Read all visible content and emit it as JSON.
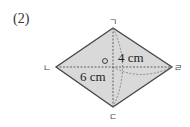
{
  "problem": {
    "number": "(2)"
  },
  "figure": {
    "shape": "rhombus",
    "vertices": {
      "top": "ㄱ",
      "left": "ㄴ",
      "bottom": "ㄷ",
      "right": "ㄹ",
      "center": "ㅇ"
    },
    "dimensions": {
      "half_vertical": "4 cm",
      "half_horizontal": "6 cm"
    },
    "colors": {
      "fill": "#d9d9d9",
      "stroke": "#444444"
    }
  }
}
